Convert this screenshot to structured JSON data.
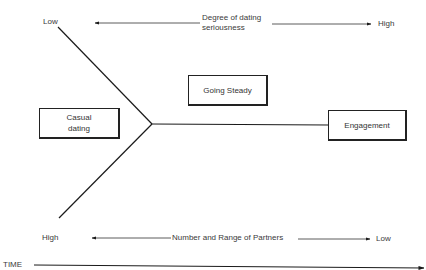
{
  "diagram": {
    "top_axis": {
      "left_label": "Low",
      "title_line1": "Degree of dating",
      "title_line2": "seriousness",
      "right_label": "High"
    },
    "bottom_axis": {
      "left_label": "High",
      "title": "Number and Range of Partners",
      "right_label": "Low"
    },
    "time_axis": {
      "label": "TIME"
    },
    "stages": [
      {
        "line1": "Casual",
        "line2": "dating"
      },
      {
        "label": "Going Steady"
      },
      {
        "label": "Engagement"
      }
    ],
    "colors": {
      "line": "#1a1a1a",
      "text": "#3a3a3a",
      "background": "#ffffff"
    }
  }
}
